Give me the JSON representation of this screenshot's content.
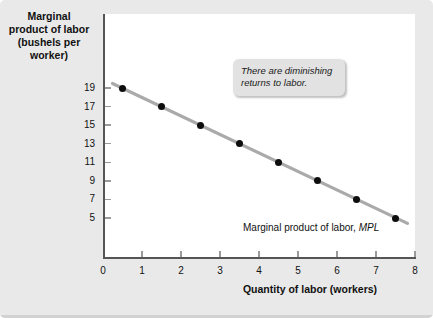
{
  "chart_data": {
    "type": "line",
    "title": "",
    "ylabel": "Marginal product of labor (bushels per worker)",
    "ylabel_lines": [
      "Marginal",
      "product of labor",
      "(bushels per",
      "worker)"
    ],
    "xlabel": "Quantity of labor (workers)",
    "xlim": [
      0,
      8
    ],
    "ylim": [
      0,
      20
    ],
    "xticks": [
      0,
      1,
      2,
      3,
      4,
      5,
      6,
      7,
      8
    ],
    "xtick_labels": [
      "0",
      "1",
      "2",
      "3",
      "4",
      "5",
      "6",
      "7",
      "8"
    ],
    "yticks": [
      19,
      17,
      15,
      13,
      11,
      9,
      7,
      5
    ],
    "ytick_labels": [
      "19",
      "17",
      "15",
      "13",
      "11",
      "9",
      "7",
      "5"
    ],
    "grid": false,
    "legend_position": "inline-right",
    "series": [
      {
        "name": "Marginal product of labor, MPL",
        "x": [
          0.5,
          1.5,
          2.5,
          3.5,
          4.5,
          5.5,
          6.5,
          7.5
        ],
        "values": [
          19,
          17,
          15,
          13,
          11,
          9,
          7,
          5
        ],
        "line_color": "#aaaaaa",
        "marker_color": "#0d0d0d"
      }
    ],
    "annotations": [
      {
        "text": "There are diminishing returns to labor.",
        "style": "callout-box"
      }
    ],
    "series_label_text": "Marginal product of labor, ",
    "series_label_italic": "MPL"
  },
  "figure": {
    "background_color": "#e9e9e9",
    "plot_background_color": "#ffffff",
    "axis_color": "#555555"
  }
}
